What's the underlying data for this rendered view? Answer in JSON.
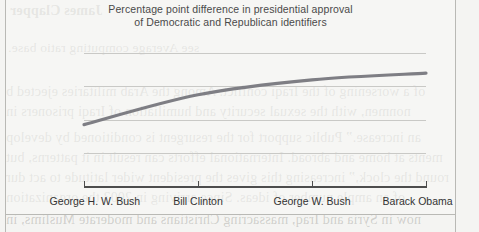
{
  "figure": {
    "title_line1": "Percentage point difference in presidential approval",
    "title_line2": "of Democratic and Republican identifiers",
    "line_color": "#7e7e84",
    "grid_color": "#c9c9c6",
    "axis_color": "#4d4d4d",
    "background_color": "#f4f4f2"
  },
  "chart_data": {
    "type": "line",
    "title": "Percentage point difference in presidential approval of Democratic and Republican identifiers",
    "xlabel": "",
    "ylabel": "",
    "categories": [
      "George H. W. Bush",
      "Bill Clinton",
      "George W. Bush",
      "Barack Obama"
    ],
    "values": [
      37,
      55,
      64,
      68
    ],
    "series": [
      {
        "name": "Percentage point difference in presidential approval",
        "values": [
          37,
          55,
          64,
          68
        ]
      }
    ],
    "ylim": [
      0,
      88
    ],
    "yticks": [
      0,
      20,
      40,
      60,
      80
    ],
    "ytick_labels": [
      "0%",
      "20%",
      "40%",
      "60%",
      "80%"
    ],
    "grid": "horizontal",
    "legend": "none"
  },
  "bleed_text": {
    "l1": "James Clapper",
    "l2": "see Average computing ratio base.",
    "l3": "of a worsening of the Iraqi conflict. Among the Arab militaries ejected b",
    "l4": "nonmen, with the sexual security and humiliation of Iraqi prisoners in",
    "l5": "an increase.”   Public support for the resurgent is conditioned by develop",
    "l6": "ments at home and abroad. International efforts can result in it patterns, but",
    "l7": "round the clock,” increasing this gives the president wider latitude to act dur",
    "l8": "of an ample number of ideas. Since arriving in 2003 the organization",
    "l9": "now in Syria and Iraq, massacring Christians and moderate Muslims, in"
  }
}
